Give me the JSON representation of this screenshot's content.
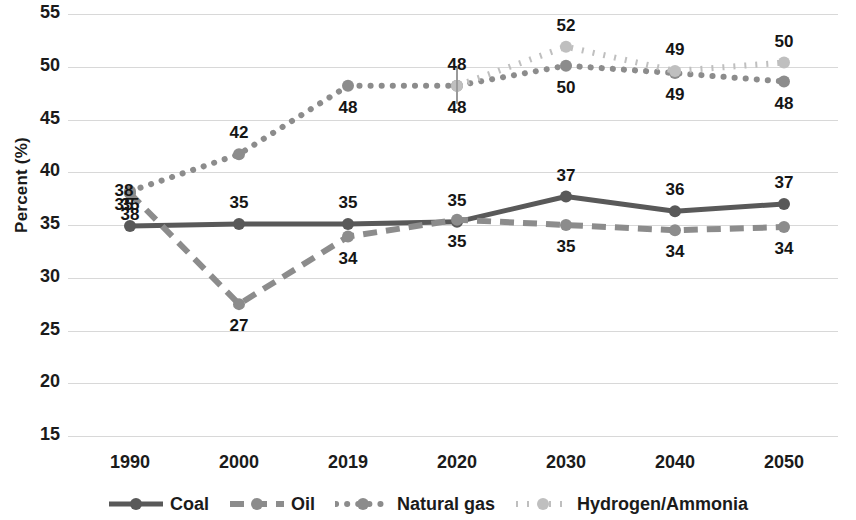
{
  "chart_data": {
    "type": "line",
    "title": "",
    "xlabel": "",
    "ylabel": "Percent (%)",
    "categories": [
      "1990",
      "2000",
      "2019",
      "2020",
      "2030",
      "2040",
      "2050"
    ],
    "ylim": [
      15,
      55
    ],
    "yticks": [
      15,
      20,
      25,
      30,
      35,
      40,
      45,
      50,
      55
    ],
    "grid": true,
    "legend_position": "bottom",
    "series": [
      {
        "name": "Coal",
        "style": "solid",
        "color": "#595959",
        "values": [
          35,
          35,
          35,
          35,
          37,
          36,
          37
        ],
        "labels": [
          "35",
          "35",
          "35",
          "35",
          "37",
          "36",
          "37"
        ],
        "label_side": [
          "above",
          "above",
          "above",
          "above",
          "above",
          "above",
          "above"
        ],
        "plot_values": [
          34.9,
          35.1,
          35.1,
          35.3,
          37.7,
          36.3,
          37.0
        ]
      },
      {
        "name": "Oil",
        "style": "dashed",
        "color": "#8c8c8c",
        "values": [
          38,
          27,
          34,
          35,
          35,
          34,
          34
        ],
        "labels": [
          "38",
          "27",
          "34",
          "35",
          "35",
          "34",
          "34"
        ],
        "label_side": [
          "below",
          "below",
          "below",
          "below",
          "below",
          "below",
          "below"
        ],
        "plot_values": [
          38.0,
          27.5,
          33.9,
          35.5,
          35.0,
          34.5,
          34.8
        ]
      },
      {
        "name": "Natural gas",
        "style": "dotted",
        "color": "#8c8c8c",
        "values": [
          38,
          42,
          48,
          48,
          50,
          49,
          48
        ],
        "labels": [
          "",
          "42",
          "48",
          "48",
          "50",
          "49",
          "48"
        ],
        "label_side": [
          "above",
          "above",
          "below",
          "below",
          "below",
          "below",
          "below"
        ],
        "plot_values": [
          38.2,
          41.7,
          48.2,
          48.2,
          50.1,
          49.4,
          48.6
        ]
      },
      {
        "name": "Hydrogen/Ammonia",
        "style": "dashdot",
        "color": "#bfbfbf",
        "values": [
          null,
          null,
          null,
          48,
          52,
          49,
          50
        ],
        "labels": [
          "",
          "",
          "",
          "48",
          "52",
          "49",
          "50"
        ],
        "label_side": [
          "above",
          "above",
          "above",
          "above",
          "above",
          "above",
          "above"
        ],
        "plot_values": [
          null,
          null,
          null,
          48.2,
          51.9,
          49.6,
          50.4
        ]
      }
    ],
    "extra_labels": [
      {
        "text": "35",
        "series": "Coal",
        "category": "1990",
        "side": "above"
      },
      {
        "text": "38",
        "series": "Oil",
        "category": "1990",
        "side": "below"
      }
    ],
    "annotation_marker": {
      "category": "2020",
      "type": "vertical-tick"
    }
  },
  "legend": {
    "items": [
      {
        "label": "Coal"
      },
      {
        "label": "Oil"
      },
      {
        "label": "Natural gas"
      },
      {
        "label": "Hydrogen/Ammonia"
      }
    ]
  },
  "axes": {
    "y_title": "Percent (%)",
    "y_ticks": [
      "55",
      "50",
      "45",
      "40",
      "35",
      "30",
      "25",
      "20",
      "15"
    ],
    "x_ticks": [
      "1990",
      "2000",
      "2019",
      "2020",
      "2030",
      "2040",
      "2050"
    ]
  }
}
